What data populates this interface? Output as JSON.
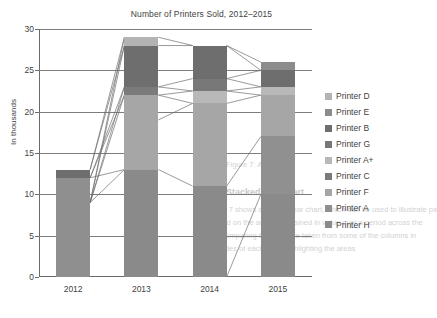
{
  "chart_data": {
    "type": "bar",
    "subtype": "stacked-bar-with-series-connectors",
    "title": "Number of Printers Sold, 2012–2015",
    "xlabel": "",
    "ylabel": "In thousands",
    "categories": [
      "2012",
      "2013",
      "2014",
      "2015"
    ],
    "ylim": [
      0,
      30
    ],
    "yticks": [
      0,
      5,
      10,
      15,
      20,
      25,
      30
    ],
    "ytick_labels": [
      "0",
      "5",
      "10",
      "15",
      "20",
      "25",
      "30"
    ],
    "grid": true,
    "legend_position": "right",
    "totals": [
      13,
      29,
      28,
      26
    ],
    "series": [
      {
        "name": "Printer D",
        "color": "#b3b3b3",
        "values": [
          0,
          1,
          0,
          0
        ]
      },
      {
        "name": "Printer E",
        "color": "#8c8c8c",
        "values": [
          0,
          0,
          0,
          1
        ]
      },
      {
        "name": "Printer B",
        "color": "#6e6e6e",
        "values": [
          1,
          5,
          4,
          2
        ]
      },
      {
        "name": "Printer G",
        "color": "#878787",
        "values": [
          0,
          0,
          1.5,
          0
        ]
      },
      {
        "name": "Printer A+",
        "color": "#b8b8b8",
        "values": [
          0,
          0,
          1.5,
          1
        ]
      },
      {
        "name": "Printer C",
        "color": "#7b7b7b",
        "values": [
          0,
          1,
          0,
          0
        ]
      },
      {
        "name": "Printer F",
        "color": "#a6a6a6",
        "values": [
          0,
          9,
          10,
          5
        ]
      },
      {
        "name": "Printer A",
        "color": "#909090",
        "values": [
          0,
          0,
          0,
          7
        ]
      },
      {
        "name": "Printer H",
        "color": "#8a8a8a",
        "values": [
          12,
          13,
          11,
          10
        ]
      }
    ],
    "stacks": [
      {
        "category": "2012",
        "total": 13,
        "segments": [
          {
            "name": "Printer H",
            "from": 0,
            "to": 12,
            "color": "#8f8f8f"
          },
          {
            "name": "Printer B",
            "from": 12,
            "to": 13,
            "color": "#6e6e6e"
          }
        ]
      },
      {
        "category": "2013",
        "total": 29,
        "segments": [
          {
            "name": "Printer H",
            "from": 0,
            "to": 13,
            "color": "#8a8a8a"
          },
          {
            "name": "Printer F",
            "from": 13,
            "to": 22,
            "color": "#a6a6a6"
          },
          {
            "name": "Printer C",
            "from": 22,
            "to": 23,
            "color": "#7b7b7b"
          },
          {
            "name": "Printer B",
            "from": 23,
            "to": 28,
            "color": "#6e6e6e"
          },
          {
            "name": "Printer D",
            "from": 28,
            "to": 29,
            "color": "#b3b3b3"
          }
        ]
      },
      {
        "category": "2014",
        "total": 28,
        "segments": [
          {
            "name": "Printer H",
            "from": 0,
            "to": 11,
            "color": "#8a8a8a"
          },
          {
            "name": "Printer F",
            "from": 11,
            "to": 21,
            "color": "#a6a6a6"
          },
          {
            "name": "Printer A+",
            "from": 21,
            "to": 22.5,
            "color": "#b8b8b8"
          },
          {
            "name": "Printer G",
            "from": 22.5,
            "to": 24,
            "color": "#787878"
          },
          {
            "name": "Printer B",
            "from": 24,
            "to": 28,
            "color": "#6e6e6e"
          }
        ]
      },
      {
        "category": "2015",
        "total": 26,
        "segments": [
          {
            "name": "Printer H",
            "from": 0,
            "to": 10,
            "color": "#8a8a8a"
          },
          {
            "name": "Printer A",
            "from": 10,
            "to": 17,
            "color": "#909090"
          },
          {
            "name": "Printer F",
            "from": 17,
            "to": 22,
            "color": "#a6a6a6"
          },
          {
            "name": "Printer A+",
            "from": 22,
            "to": 23,
            "color": "#b8b8b8"
          },
          {
            "name": "Printer B",
            "from": 23,
            "to": 25,
            "color": "#6e6e6e"
          },
          {
            "name": "Printer E",
            "from": 25,
            "to": 26,
            "color": "#8c8c8c"
          }
        ]
      }
    ],
    "connectors": [
      {
        "from": [
          0,
          13
        ],
        "to": [
          1,
          29
        ]
      },
      {
        "from": [
          0,
          13
        ],
        "to": [
          1,
          28
        ]
      },
      {
        "from": [
          0,
          12
        ],
        "to": [
          1,
          23
        ]
      },
      {
        "from": [
          0,
          12
        ],
        "to": [
          1,
          22
        ]
      },
      {
        "from": [
          0,
          12
        ],
        "to": [
          1,
          13
        ]
      },
      {
        "from": [
          0,
          9
        ],
        "to": [
          1,
          29
        ]
      },
      {
        "from": [
          0,
          9
        ],
        "to": [
          1,
          28
        ]
      },
      {
        "from": [
          0,
          9
        ],
        "to": [
          1,
          23
        ]
      },
      {
        "from": [
          0,
          9
        ],
        "to": [
          1,
          22
        ]
      },
      {
        "from": [
          0,
          9
        ],
        "to": [
          1,
          13
        ]
      },
      {
        "from": [
          1,
          29
        ],
        "to": [
          2,
          28
        ]
      },
      {
        "from": [
          1,
          28
        ],
        "to": [
          2,
          28
        ]
      },
      {
        "from": [
          1,
          23
        ],
        "to": [
          2,
          24
        ]
      },
      {
        "from": [
          1,
          23
        ],
        "to": [
          2,
          22.5
        ]
      },
      {
        "from": [
          1,
          22
        ],
        "to": [
          2,
          22.5
        ]
      },
      {
        "from": [
          1,
          22
        ],
        "to": [
          2,
          21
        ]
      },
      {
        "from": [
          1,
          19
        ],
        "to": [
          2,
          21
        ]
      },
      {
        "from": [
          1,
          13
        ],
        "to": [
          2,
          11
        ]
      },
      {
        "from": [
          2,
          28
        ],
        "to": [
          3,
          26
        ]
      },
      {
        "from": [
          2,
          28
        ],
        "to": [
          3,
          25
        ]
      },
      {
        "from": [
          2,
          24
        ],
        "to": [
          3,
          25
        ]
      },
      {
        "from": [
          2,
          24
        ],
        "to": [
          3,
          23
        ]
      },
      {
        "from": [
          2,
          22.5
        ],
        "to": [
          3,
          23
        ]
      },
      {
        "from": [
          2,
          22.5
        ],
        "to": [
          3,
          22
        ]
      },
      {
        "from": [
          2,
          21
        ],
        "to": [
          3,
          22
        ]
      },
      {
        "from": [
          2,
          11
        ],
        "to": [
          3,
          17
        ]
      },
      {
        "from": [
          2,
          0
        ],
        "to": [
          3,
          10
        ]
      }
    ]
  },
  "legend": {
    "items": [
      {
        "label": "Printer D",
        "color": "#b3b3b3"
      },
      {
        "label": "Printer E",
        "color": "#8c8c8c"
      },
      {
        "label": "Printer B",
        "color": "#6e6e6e"
      },
      {
        "label": "Printer G",
        "color": "#787878"
      },
      {
        "label": "Printer A+",
        "color": "#b8b8b8"
      },
      {
        "label": "Printer C",
        "color": "#7b7b7b"
      },
      {
        "label": "Printer F",
        "color": "#a6a6a6"
      },
      {
        "label": "Printer A",
        "color": "#909090"
      },
      {
        "label": "Printer H",
        "color": "#8a8a8a"
      }
    ]
  },
  "background_page_text": {
    "heading": "Stacked Bar Chart",
    "lines": [
      "1. Figure 7 shows a stacked bar chart, which can be used to illustrate pa",
      "is overlaid on the actual, sustained in value over a period across the",
      "and by comparing the variance taken from some of the columns in",
      "own shades of each color highlighting the areas"
    ],
    "caption": "Figure 7: An exa"
  }
}
